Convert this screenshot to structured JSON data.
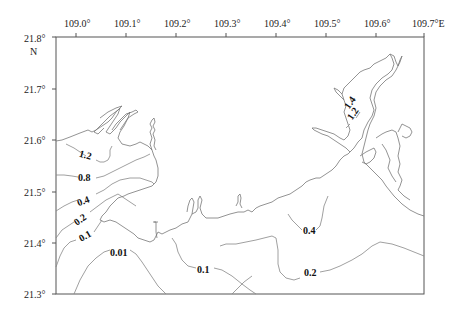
{
  "map": {
    "x_axis": {
      "unit_suffix": "E",
      "ticks": [
        {
          "label": "109.0°",
          "x": 76
        },
        {
          "label": "109.1°",
          "x": 126
        },
        {
          "label": "109.2°",
          "x": 176
        },
        {
          "label": "109.3°",
          "x": 226
        },
        {
          "label": "109.4°",
          "x": 276
        },
        {
          "label": "109.5°",
          "x": 326
        },
        {
          "label": "109.6°",
          "x": 376
        },
        {
          "label": "109.7°E",
          "x": 424
        }
      ]
    },
    "y_axis": {
      "unit_suffix": "N",
      "ticks": [
        {
          "label": "21.8°",
          "y": 37
        },
        {
          "label": "21.7°",
          "y": 89
        },
        {
          "label": "21.6°",
          "y": 140
        },
        {
          "label": "21.5°",
          "y": 192
        },
        {
          "label": "21.4°",
          "y": 243
        },
        {
          "label": "21.3°",
          "y": 294
        }
      ],
      "north_label": "N"
    },
    "contour_labels": [
      {
        "id": "c12-west",
        "text": "1.2",
        "x": 88,
        "y": 156,
        "rotate": 15
      },
      {
        "id": "c08",
        "text": "0.8",
        "x": 84,
        "y": 178,
        "rotate": 0
      },
      {
        "id": "c04-west",
        "text": "0.4",
        "x": 84,
        "y": 201,
        "rotate": -20
      },
      {
        "id": "c02-west",
        "text": "0.2",
        "x": 80,
        "y": 220,
        "rotate": -35
      },
      {
        "id": "c01-west",
        "text": "0.1",
        "x": 84,
        "y": 237,
        "rotate": -30
      },
      {
        "id": "c001",
        "text": "0.01",
        "x": 117,
        "y": 253,
        "rotate": 0
      },
      {
        "id": "c01-south",
        "text": "0.1",
        "x": 202,
        "y": 272,
        "rotate": 0
      },
      {
        "id": "c04-east",
        "text": "0.4",
        "x": 308,
        "y": 234,
        "rotate": 0
      },
      {
        "id": "c02-east",
        "text": "0.2",
        "x": 310,
        "y": 276,
        "rotate": 0
      },
      {
        "id": "c14-bay",
        "text": "1.4",
        "x": 349,
        "y": 103,
        "rotate": -55
      },
      {
        "id": "c12-bay",
        "text": "1.2",
        "x": 352,
        "y": 114,
        "rotate": -55
      }
    ],
    "contour_levels": [
      0.01,
      0.1,
      0.2,
      0.4,
      0.8,
      1.2,
      1.4
    ],
    "colors": {
      "frame": "#555555",
      "coastline": "#777777",
      "contour": "#888888",
      "text": "#222222"
    }
  }
}
